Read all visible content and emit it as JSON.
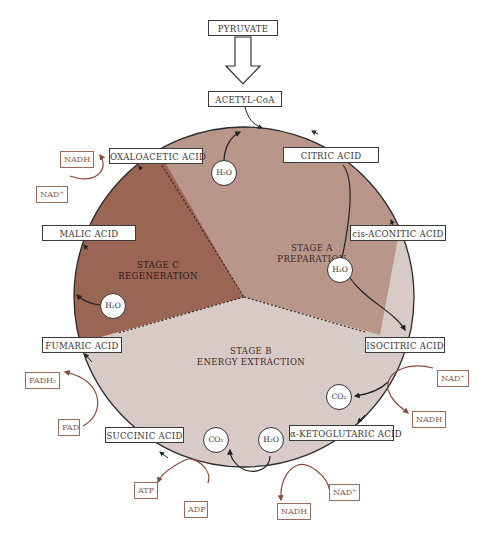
{
  "colors": {
    "stage_a": "#b9968a",
    "stage_b": "#d8cac6",
    "stage_c": "#9a6553",
    "cofactor_border": "#9a6a5a",
    "cofactor_text": "#8a5a4a",
    "arrow_brown": "#8a4a3a",
    "outline": "#333333"
  },
  "inputs": {
    "pyruvate": "PYRUVATE",
    "acetyl_coa": "ACETYL-CoA"
  },
  "intermediates": {
    "oxaloacetic": "OXALOACETIC ACID",
    "citric": "CITRIC ACID",
    "cis_aconitic": "cis-ACONITIC ACID",
    "isocitric": "ISOCITRIC ACID",
    "ketoglutaric": "α-KETOGLUTARIC ACID",
    "succinic": "SUCCINIC ACID",
    "fumaric": "FUMARIC ACID",
    "malic": "MALIC ACID"
  },
  "stages": {
    "a": {
      "line1": "STAGE A",
      "line2": "PREPARATION"
    },
    "b": {
      "line1": "STAGE B",
      "line2": "ENERGY EXTRACTION"
    },
    "c": {
      "line1": "STAGE C",
      "line2": "REGENERATION"
    }
  },
  "molecules": {
    "h2o_top": "H₂O",
    "h2o_right": "H₂O",
    "h2o_left": "H₂O",
    "h2o_bottom": "H₂O",
    "co2_right": "CO₂",
    "co2_bottom": "CO₂"
  },
  "cofactors": {
    "nadh_top_left": "NADH",
    "nad_top_left": "NAD⁺",
    "fadh2": "FADH₂",
    "fad": "FAD",
    "atp": "ATP",
    "adp": "ADP",
    "nad_right": "NAD⁺",
    "nadh_right": "NADH",
    "nad_bottom": "NAD⁺",
    "nadh_bottom": "NADH"
  }
}
